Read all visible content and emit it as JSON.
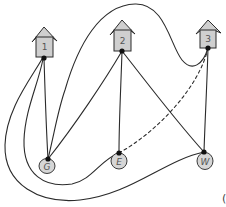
{
  "diagram": {
    "houses": [
      {
        "id": "1",
        "label": "1"
      },
      {
        "id": "2",
        "label": "2"
      },
      {
        "id": "3",
        "label": "3"
      }
    ],
    "utilities": [
      {
        "id": "G",
        "label": "G"
      },
      {
        "id": "E",
        "label": "E"
      },
      {
        "id": "W",
        "label": "W"
      }
    ],
    "edges": [
      {
        "from": "1",
        "to": "G",
        "style": "solid"
      },
      {
        "from": "1",
        "to": "E",
        "style": "solid"
      },
      {
        "from": "1",
        "to": "W",
        "style": "solid"
      },
      {
        "from": "2",
        "to": "G",
        "style": "solid"
      },
      {
        "from": "2",
        "to": "E",
        "style": "solid"
      },
      {
        "from": "2",
        "to": "W",
        "style": "solid"
      },
      {
        "from": "3",
        "to": "G",
        "style": "solid"
      },
      {
        "from": "3",
        "to": "W",
        "style": "solid"
      },
      {
        "from": "3",
        "to": "E",
        "style": "dashed"
      }
    ],
    "corner_glyph": "("
  },
  "colors": {
    "node_fill": "#cfcfcf",
    "stroke": "#2b2b2b",
    "background": "#ffffff"
  }
}
